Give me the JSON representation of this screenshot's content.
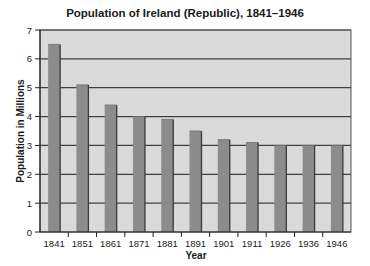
{
  "chart_data": {
    "type": "bar",
    "title": "Population of Ireland (Republic), 1841–1946",
    "xlabel": "Year",
    "ylabel": "Population in Millions",
    "categories": [
      "1841",
      "1851",
      "1861",
      "1871",
      "1881",
      "1891",
      "1901",
      "1911",
      "1926",
      "1936",
      "1946"
    ],
    "values": [
      6.5,
      5.1,
      4.4,
      4.0,
      3.9,
      3.5,
      3.2,
      3.1,
      3.0,
      3.0,
      3.0
    ],
    "ylim": [
      0,
      7
    ],
    "yticks": [
      0,
      1,
      2,
      3,
      4,
      5,
      6,
      7
    ],
    "grid": true,
    "legend": null,
    "colors": {
      "plot_background": "#dadada",
      "bar_fill": "#8c8c8c",
      "bar_edge": "#3a3a3a",
      "gridline": "#404040"
    }
  }
}
